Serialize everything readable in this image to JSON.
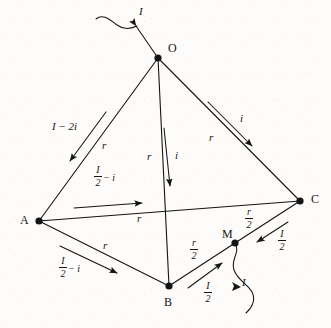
{
  "figure": {
    "type": "circuit-diagram",
    "background_color": "#fdfcfa",
    "ink_color": "#141414"
  },
  "nodes": [
    {
      "id": "O",
      "label": "O",
      "x": 158,
      "y": 58,
      "label_x": 168,
      "label_y": 42
    },
    {
      "id": "A",
      "label": "A",
      "x": 39,
      "y": 221,
      "label_x": 20,
      "label_y": 214
    },
    {
      "id": "B",
      "label": "B",
      "x": 169,
      "y": 286,
      "label_x": 164,
      "label_y": 296
    },
    {
      "id": "C",
      "label": "C",
      "x": 300,
      "y": 201,
      "label_x": 311,
      "label_y": 193
    },
    {
      "id": "M",
      "label": "M",
      "x": 235,
      "y": 243,
      "label_x": 222,
      "label_y": 228
    }
  ],
  "edges": [
    {
      "id": "OA",
      "from": "O",
      "to": "A",
      "resistance": "r",
      "current": "I − 2i"
    },
    {
      "id": "OB",
      "from": "O",
      "to": "B",
      "resistance": "r",
      "current": "i"
    },
    {
      "id": "OC",
      "from": "O",
      "to": "C",
      "resistance": "r",
      "current": "i"
    },
    {
      "id": "AC",
      "from": "A",
      "to": "C",
      "resistance": "r",
      "current": "I/2 − i"
    },
    {
      "id": "AB",
      "from": "A",
      "to": "B",
      "resistance": "r",
      "current": "I/2 − i"
    },
    {
      "id": "BM",
      "from": "B",
      "to": "M",
      "resistance": "r/2",
      "current": "I/2"
    },
    {
      "id": "MC",
      "from": "M",
      "to": "C",
      "resistance": "r/2",
      "current": "I/2"
    }
  ],
  "leads": [
    {
      "id": "lead-in",
      "at_node": "O",
      "label": "I",
      "label_x": 139,
      "label_y": 6,
      "direction": "into-node"
    },
    {
      "id": "lead-out",
      "at_node": "M",
      "label": "I",
      "label_x": 242,
      "label_y": 277,
      "direction": "out-of-node"
    }
  ],
  "labels": {
    "lead_in_current": {
      "text": "I",
      "x": 139,
      "y": 6
    },
    "lead_out_current": {
      "text": "I",
      "x": 242,
      "y": 277
    },
    "oa_current": {
      "text": "I − 2i",
      "x": 52,
      "y": 121
    },
    "oa_resistance": {
      "text": "r",
      "x": 102,
      "y": 140
    },
    "ob_resistance": {
      "text": "r",
      "x": 147,
      "y": 151
    },
    "ob_current": {
      "text": "i",
      "x": 175,
      "y": 150
    },
    "oc_resistance": {
      "text": "r",
      "x": 209,
      "y": 132
    },
    "oc_current": {
      "text": "i",
      "x": 240,
      "y": 113
    },
    "ac_current_num": {
      "text": "I",
      "x": 98,
      "y": 170
    },
    "ac_current_den": {
      "text": "2",
      "x": 98,
      "y": 182
    },
    "ac_current_tail": {
      "text": "− i",
      "x": 107,
      "y": 176
    },
    "ac_resistance": {
      "text": "r",
      "x": 137,
      "y": 213
    },
    "ab_resistance": {
      "text": "r",
      "x": 103,
      "y": 240
    },
    "ab_current_num": {
      "text": "I",
      "x": 63,
      "y": 261
    },
    "ab_current_den": {
      "text": "2",
      "x": 63,
      "y": 273
    },
    "ab_current_tail": {
      "text": "− i",
      "x": 72,
      "y": 267
    },
    "bm_resistance_num": {
      "text": "r",
      "x": 193,
      "y": 243
    },
    "bm_resistance_den": {
      "text": "2",
      "x": 193,
      "y": 255
    },
    "bm_current_num": {
      "text": "I",
      "x": 207,
      "y": 286
    },
    "bm_current_den": {
      "text": "2",
      "x": 207,
      "y": 298
    },
    "mc_resistance_num": {
      "text": "r",
      "x": 248,
      "y": 212
    },
    "mc_resistance_den": {
      "text": "2",
      "x": 248,
      "y": 224
    },
    "mc_current_num": {
      "text": "I",
      "x": 281,
      "y": 234
    },
    "mc_current_den": {
      "text": "2",
      "x": 281,
      "y": 246
    }
  },
  "fractions": {
    "half_I_minus_i": {
      "numerator": "I",
      "denominator": "2",
      "tail": "− i"
    },
    "half_r": {
      "numerator": "r",
      "denominator": "2",
      "tail": ""
    },
    "half_I": {
      "numerator": "I",
      "denominator": "2",
      "tail": ""
    }
  }
}
